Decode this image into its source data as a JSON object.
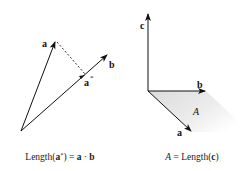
{
  "left_diagram": {
    "labels": {
      "a": "a",
      "b": "b",
      "a_star": "a",
      "a_star_sup": "*"
    },
    "caption": {
      "prefix": "Length(",
      "bold_a": "a",
      "sup": "*",
      "mid": ") = ",
      "bold_a2": "a",
      "dot": " · ",
      "bold_b": "b"
    }
  },
  "right_diagram": {
    "labels": {
      "c": "c",
      "b": "b",
      "a": "a",
      "area": "A"
    },
    "caption": {
      "area": "A",
      "eq": " = Length(",
      "bold_c": "c",
      "close": ")"
    }
  },
  "colors": {
    "stroke": "#111111",
    "shade": "#e6e6e6"
  }
}
